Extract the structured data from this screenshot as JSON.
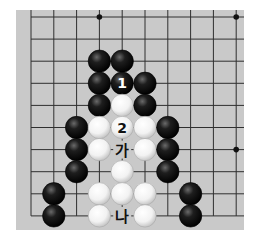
{
  "diagram": {
    "type": "go-board-problem",
    "board": {
      "background": "#c9c9c9",
      "line_color": "#2f2f2f",
      "columns": 10,
      "rows": 10,
      "origin_x": 31,
      "origin_y": 17,
      "step_x": 22.8,
      "step_y": 22.1,
      "edges": {
        "left": true,
        "bottom": true,
        "top": false,
        "right": false
      },
      "hoshi": [
        {
          "col": 3,
          "row": 0
        },
        {
          "col": 9,
          "row": 0
        },
        {
          "col": 9,
          "row": 6
        }
      ]
    },
    "stones": [
      {
        "color": "black",
        "col": 3,
        "row": 2
      },
      {
        "color": "black",
        "col": 4,
        "row": 2
      },
      {
        "color": "black",
        "col": 3,
        "row": 3
      },
      {
        "color": "black",
        "col": 4,
        "row": 3,
        "label": "1"
      },
      {
        "color": "black",
        "col": 5,
        "row": 3
      },
      {
        "color": "black",
        "col": 3,
        "row": 4
      },
      {
        "color": "white",
        "col": 4,
        "row": 4
      },
      {
        "color": "black",
        "col": 5,
        "row": 4
      },
      {
        "color": "black",
        "col": 2,
        "row": 5
      },
      {
        "color": "white",
        "col": 3,
        "row": 5
      },
      {
        "color": "white",
        "col": 4,
        "row": 5,
        "label": "2"
      },
      {
        "color": "white",
        "col": 5,
        "row": 5
      },
      {
        "color": "black",
        "col": 6,
        "row": 5
      },
      {
        "color": "black",
        "col": 2,
        "row": 6
      },
      {
        "color": "white",
        "col": 3,
        "row": 6
      },
      {
        "color": "white",
        "col": 5,
        "row": 6
      },
      {
        "color": "black",
        "col": 6,
        "row": 6
      },
      {
        "color": "black",
        "col": 2,
        "row": 7
      },
      {
        "color": "white",
        "col": 4,
        "row": 7
      },
      {
        "color": "black",
        "col": 6,
        "row": 7
      },
      {
        "color": "black",
        "col": 1,
        "row": 8
      },
      {
        "color": "white",
        "col": 3,
        "row": 8
      },
      {
        "color": "white",
        "col": 4,
        "row": 8
      },
      {
        "color": "white",
        "col": 5,
        "row": 8
      },
      {
        "color": "black",
        "col": 7,
        "row": 8
      },
      {
        "color": "black",
        "col": 1,
        "row": 9
      },
      {
        "color": "white",
        "col": 3,
        "row": 9
      },
      {
        "color": "white",
        "col": 5,
        "row": 9
      },
      {
        "color": "black",
        "col": 7,
        "row": 9
      }
    ],
    "point_labels": [
      {
        "col": 4,
        "row": 6,
        "text": "가"
      },
      {
        "col": 4,
        "row": 9,
        "text": "나"
      }
    ]
  }
}
